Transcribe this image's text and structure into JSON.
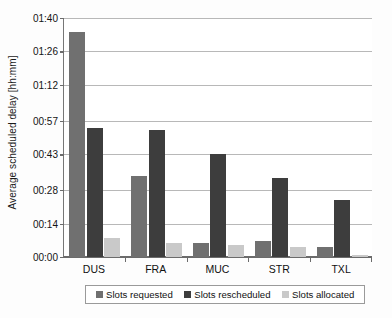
{
  "chart_data": {
    "type": "bar",
    "title": "",
    "subtitle": "",
    "xlabel": "",
    "ylabel": "Average scheduled delay [hh:mm]",
    "categories": [
      "DUS",
      "FRA",
      "MUC",
      "STR",
      "TXL"
    ],
    "series": [
      {
        "name": "Slots requested",
        "color": "#707070",
        "values": [
          94,
          34,
          6,
          6.5,
          4
        ],
        "value_labels": [
          "01:34",
          "00:34",
          "00:06",
          "00:07",
          "00:04"
        ]
      },
      {
        "name": "Slots rescheduled",
        "color": "#3d3d3d",
        "values": [
          54,
          53,
          43,
          33,
          24
        ],
        "value_labels": [
          "00:54",
          "00:53",
          "00:42",
          "00:33",
          "00:24"
        ]
      },
      {
        "name": "Slots allocated",
        "color": "#c9c9c9",
        "values": [
          8,
          6,
          5,
          4,
          1
        ],
        "value_labels": [
          "00:08",
          "00:06",
          "00:05",
          "00:04",
          "00:01"
        ]
      }
    ],
    "yticks": [
      0,
      14,
      28,
      43,
      57,
      72,
      86,
      100
    ],
    "ytick_labels": [
      "00:00",
      "00:14",
      "00:28",
      "00:43",
      "00:57",
      "01:12",
      "01:26",
      "01:40"
    ],
    "ylim": [
      0,
      100
    ],
    "y_unit": "minutes",
    "grid": true,
    "legend_position": "bottom"
  },
  "legend": {
    "items": [
      {
        "label": "Slots requested",
        "color": "#707070"
      },
      {
        "label": "Slots rescheduled",
        "color": "#3d3d3d"
      },
      {
        "label": "Slots allocated",
        "color": "#c9c9c9"
      }
    ]
  }
}
